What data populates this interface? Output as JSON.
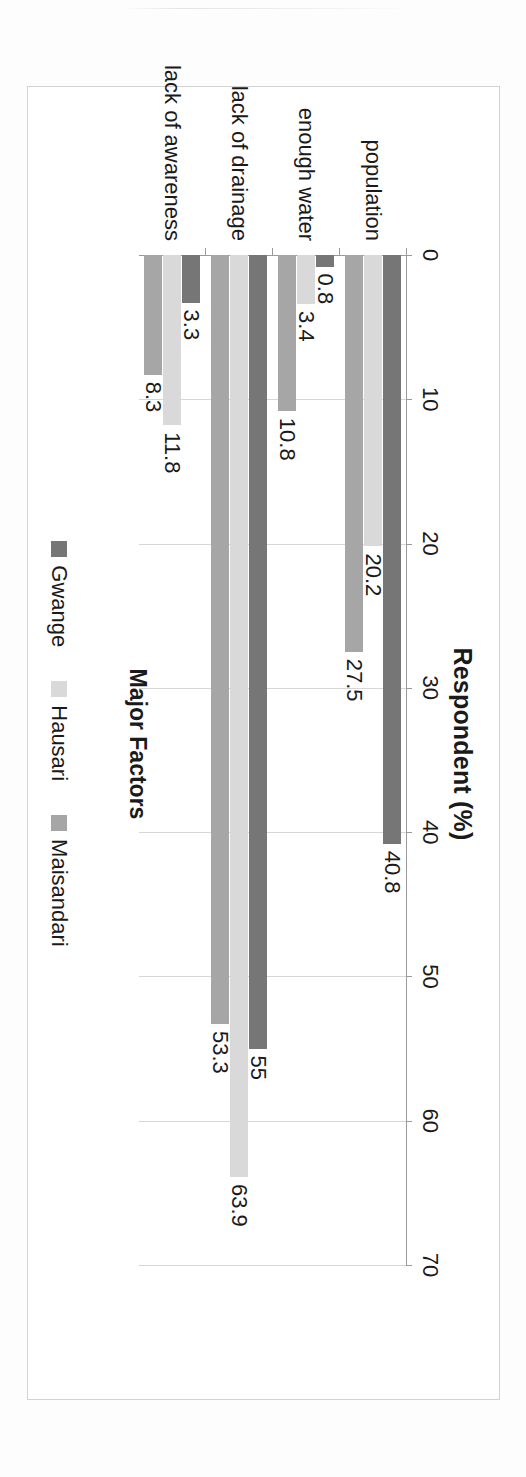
{
  "figure": {
    "rotation_note": "rotated-90-clockwise",
    "value_axis_title": "Respondent (%)",
    "category_axis_title": "Major Factors"
  },
  "colors": {
    "gwange": "#767676",
    "hausari": "#d9d9d9",
    "maisandari": "#a6a6a6",
    "axis": "#9a9a9a",
    "gridline": "#d6d6d6",
    "frame": "#d2d2d2",
    "text": "#1a1a1a"
  },
  "legend": {
    "position": "bottom",
    "items": [
      {
        "label": "Gwange",
        "color": "#767676"
      },
      {
        "label": "Hausari",
        "color": "#d9d9d9"
      },
      {
        "label": "Maisandari",
        "color": "#a6a6a6"
      }
    ]
  },
  "chart_data": {
    "type": "bar",
    "orientation": "horizontal",
    "title": "",
    "xlabel": "Respondent (%)",
    "ylabel": "Major Factors",
    "xlim": [
      0,
      70
    ],
    "grid": true,
    "ticks": [
      0,
      10,
      20,
      30,
      40,
      50,
      60,
      70
    ],
    "tick_labels": [
      "0",
      "10",
      "20",
      "30",
      "40",
      "50",
      "60",
      "70"
    ],
    "categories": [
      "population",
      "enough water",
      "lack of drainage",
      "lack of awareness"
    ],
    "series": [
      {
        "name": "Gwange",
        "color": "#767676",
        "values": [
          40.8,
          0.8,
          55,
          3.3
        ],
        "labels": [
          "40.8",
          "0.8",
          "55",
          "3.3"
        ]
      },
      {
        "name": "Hausari",
        "color": "#d9d9d9",
        "values": [
          20.2,
          3.4,
          63.9,
          11.8
        ],
        "labels": [
          "20.2",
          "3.4",
          "63.9",
          "11.8"
        ]
      },
      {
        "name": "Maisandari",
        "color": "#a6a6a6",
        "values": [
          27.5,
          10.8,
          53.3,
          8.3
        ],
        "labels": [
          "27.5",
          "10.8",
          "53.3",
          "8.3"
        ]
      }
    ]
  }
}
